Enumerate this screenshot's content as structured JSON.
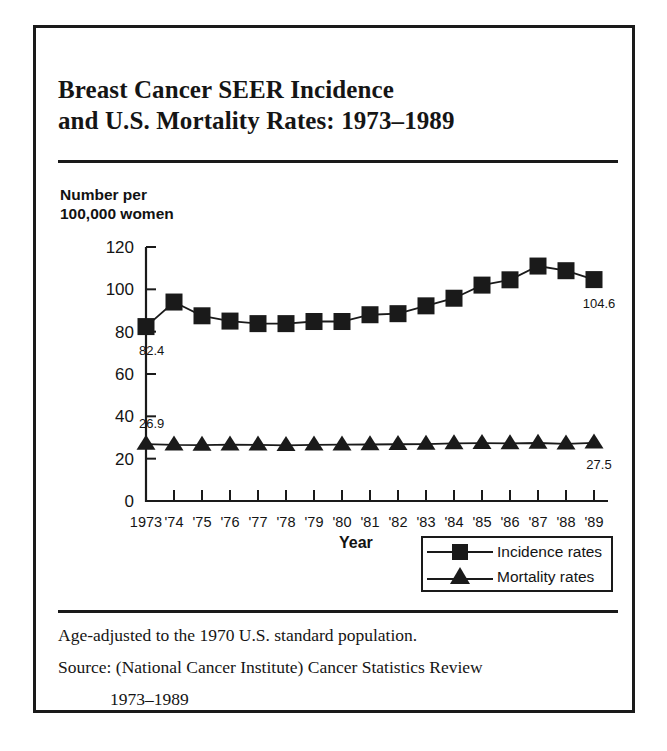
{
  "figure": {
    "title_lines": [
      "Breast Cancer SEER Incidence",
      "and U.S. Mortality Rates: 1973–1989"
    ],
    "y_axis_caption_lines": [
      "Number per",
      "100,000 women"
    ],
    "x_axis_title": "Year",
    "footnotes": [
      "Age-adjusted to the 1970 U.S. standard population.",
      "Source: (National Cancer Institute) Cancer Statistics Review",
      "1973–1989"
    ]
  },
  "legend": {
    "entries": [
      {
        "label": "Incidence rates",
        "marker": "square-marker-icon"
      },
      {
        "label": "Mortality rates",
        "marker": "triangle-marker-icon"
      }
    ]
  },
  "chart_data": {
    "type": "line",
    "title": "Breast Cancer SEER Incidence and U.S. Mortality Rates: 1973–1989",
    "xlabel": "Year",
    "ylabel": "Number per 100,000 women",
    "x": [
      1973,
      1974,
      1975,
      1976,
      1977,
      1978,
      1979,
      1980,
      1981,
      1982,
      1983,
      1984,
      1985,
      1986,
      1987,
      1988,
      1989
    ],
    "tick_labels": [
      "1973",
      "'74",
      "'75",
      "'76",
      "'77",
      "'78",
      "'79",
      "'80",
      "'81",
      "'82",
      "'83",
      "'84",
      "'85",
      "'86",
      "'87",
      "'88",
      "'89"
    ],
    "ylim": [
      0,
      120
    ],
    "yticks": [
      0,
      20,
      40,
      60,
      80,
      100,
      120
    ],
    "grid": false,
    "legend_position": "bottom-right",
    "series": [
      {
        "name": "Incidence rates",
        "marker": "square",
        "values": [
          82.4,
          94.0,
          87.5,
          85.0,
          83.8,
          83.8,
          84.8,
          84.8,
          88.0,
          88.5,
          92.2,
          95.8,
          102.0,
          104.5,
          111.0,
          108.8,
          104.6
        ],
        "endpoint_labels": {
          "first": "82.4",
          "last": "104.6"
        }
      },
      {
        "name": "Mortality rates",
        "marker": "triangle",
        "values": [
          26.9,
          26.5,
          26.4,
          26.6,
          26.5,
          26.3,
          26.5,
          26.6,
          26.7,
          26.8,
          26.9,
          27.2,
          27.3,
          27.2,
          27.4,
          27.0,
          27.5
        ],
        "endpoint_labels": {
          "first": "26.9",
          "last": "27.5"
        }
      }
    ]
  }
}
